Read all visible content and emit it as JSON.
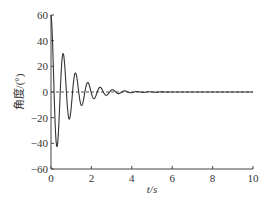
{
  "chart_data": {
    "type": "line",
    "title": "",
    "xlabel": "t/s",
    "ylabel": "角度/(°)",
    "xlim": [
      0,
      10
    ],
    "ylim": [
      -60,
      60
    ],
    "xticks": [
      "0",
      "2",
      "4",
      "6",
      "8",
      "10"
    ],
    "yticks": [
      "60",
      "40",
      "20",
      "0",
      "-20",
      "-40",
      "-60"
    ],
    "grid": false,
    "reference_line": {
      "y": 0,
      "style": "dashed"
    },
    "series": [
      {
        "name": "angle",
        "model": "damped oscillation",
        "points": [
          [
            0,
            60
          ],
          [
            0.25,
            -42
          ],
          [
            0.55,
            30
          ],
          [
            0.85,
            -23
          ],
          [
            1.15,
            15
          ],
          [
            1.45,
            -11
          ],
          [
            1.75,
            8
          ],
          [
            2.05,
            -6
          ],
          [
            2.4,
            4
          ],
          [
            2.7,
            -3
          ],
          [
            3.0,
            2
          ],
          [
            3.5,
            1
          ],
          [
            4.0,
            0.5
          ],
          [
            5.0,
            0
          ],
          [
            10,
            0
          ]
        ],
        "amplitude": 60,
        "decay": 1.15,
        "omega": 10.3
      }
    ]
  }
}
